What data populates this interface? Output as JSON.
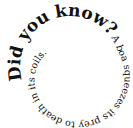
{
  "spiral_text": {
    "headline": "Did you know?",
    "fact": "A boa squeezes its prey to death in its coils."
  },
  "colors": {
    "text": "#111111",
    "background": "#ffffff"
  }
}
